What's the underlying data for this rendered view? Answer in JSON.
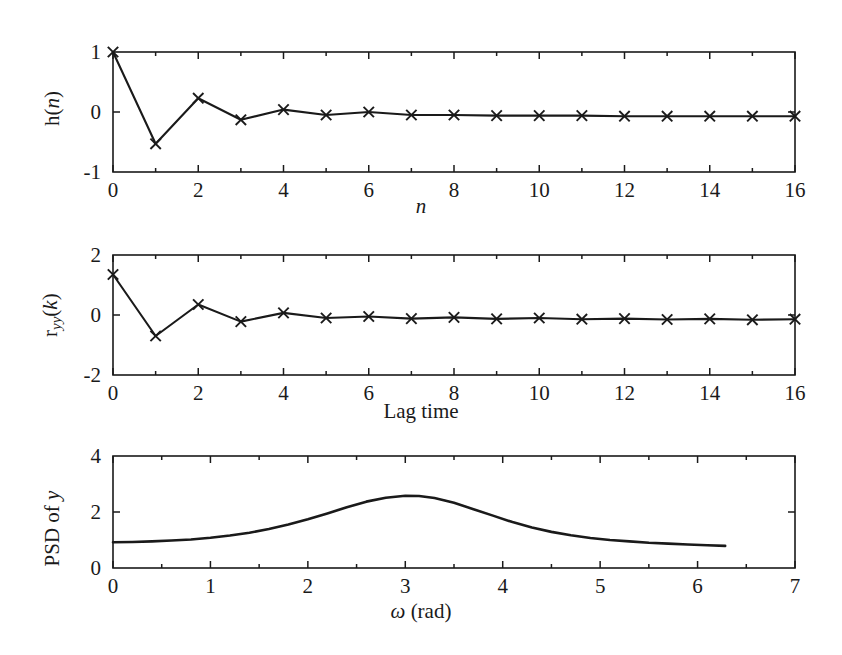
{
  "figure": {
    "background_color": "#ffffff",
    "line_color": "#1a1a1a",
    "marker_symbol": "x"
  },
  "panels": [
    {
      "name": "impulse-response",
      "ylabel_prefix": "h(",
      "ylabel_italic": "n",
      "ylabel_suffix": ")",
      "xlabel_italic": "n",
      "xlabel_prefix": "",
      "xlabel_suffix": "",
      "xticks": [
        "0",
        "2",
        "4",
        "6",
        "8",
        "10",
        "12",
        "14",
        "16"
      ],
      "yticks": [
        "-1",
        "0",
        "1"
      ]
    },
    {
      "name": "autocorrelation",
      "ylabel_prefix": "r",
      "ylabel_sub": "yy",
      "ylabel_mid": "(",
      "ylabel_italic": "k",
      "ylabel_suffix": ")",
      "xlabel": "Lag time",
      "xticks": [
        "0",
        "2",
        "4",
        "6",
        "8",
        "10",
        "12",
        "14",
        "16"
      ],
      "yticks": [
        "-2",
        "0",
        "2"
      ]
    },
    {
      "name": "power-spectral-density",
      "ylabel_prefix": "PSD of ",
      "ylabel_italic": "y",
      "xlabel_symbol": "ω",
      "xlabel_rest": " (rad)",
      "xticks": [
        "0",
        "1",
        "2",
        "3",
        "4",
        "5",
        "6",
        "7"
      ],
      "yticks": [
        "0",
        "2",
        "4"
      ]
    }
  ],
  "chart_data": [
    {
      "type": "line",
      "title": "",
      "xlabel": "n",
      "ylabel": "h(n)",
      "xlim": [
        0,
        16
      ],
      "ylim": [
        -1,
        1
      ],
      "xticks": [
        0,
        2,
        4,
        6,
        8,
        10,
        12,
        14,
        16
      ],
      "yticks": [
        -1,
        0,
        1
      ],
      "minor_xticks": [
        1,
        3,
        5,
        7,
        9,
        11,
        13,
        15
      ],
      "grid": false,
      "legend": null,
      "marker": "x",
      "x": [
        0,
        1,
        2,
        3,
        4,
        5,
        6,
        7,
        8,
        9,
        10,
        11,
        12,
        13,
        14,
        15,
        16
      ],
      "values": [
        1.0,
        -0.53,
        0.23,
        -0.13,
        0.04,
        -0.05,
        0.0,
        -0.05,
        -0.05,
        -0.06,
        -0.06,
        -0.06,
        -0.07,
        -0.07,
        -0.07,
        -0.07,
        -0.07
      ]
    },
    {
      "type": "line",
      "title": "",
      "xlabel": "Lag time",
      "ylabel": "r_yy(k)",
      "xlim": [
        0,
        16
      ],
      "ylim": [
        -2,
        2
      ],
      "xticks": [
        0,
        2,
        4,
        6,
        8,
        10,
        12,
        14,
        16
      ],
      "yticks": [
        -2,
        0,
        2
      ],
      "minor_xticks": [
        1,
        3,
        5,
        7,
        9,
        11,
        13,
        15
      ],
      "grid": false,
      "legend": null,
      "marker": "x",
      "x": [
        0,
        1,
        2,
        3,
        4,
        5,
        6,
        7,
        8,
        9,
        10,
        11,
        12,
        13,
        14,
        15,
        16
      ],
      "values": [
        1.35,
        -0.7,
        0.35,
        -0.22,
        0.07,
        -0.1,
        -0.05,
        -0.12,
        -0.08,
        -0.13,
        -0.1,
        -0.14,
        -0.12,
        -0.15,
        -0.13,
        -0.16,
        -0.14
      ]
    },
    {
      "type": "line",
      "title": "",
      "xlabel": "ω (rad)",
      "ylabel": "PSD of y",
      "xlim": [
        0,
        7
      ],
      "ylim": [
        0,
        4
      ],
      "xticks": [
        0,
        1,
        2,
        3,
        4,
        5,
        6,
        7
      ],
      "yticks": [
        0,
        2,
        4
      ],
      "minor_xticks": [
        0.5,
        1.5,
        2.5,
        3.5,
        4.5,
        5.5,
        6.5
      ],
      "grid": false,
      "legend": null,
      "marker": "none",
      "x": [
        0.0,
        0.2,
        0.4,
        0.6,
        0.8,
        1.0,
        1.2,
        1.4,
        1.6,
        1.8,
        2.0,
        2.2,
        2.4,
        2.6,
        2.8,
        3.0,
        3.1416,
        3.3,
        3.5,
        3.7,
        3.9,
        4.1,
        4.3,
        4.5,
        4.7,
        4.9,
        5.1,
        5.3,
        5.5,
        5.7,
        5.9,
        6.1,
        6.2832
      ],
      "values": [
        0.92,
        0.93,
        0.95,
        0.98,
        1.02,
        1.08,
        1.16,
        1.26,
        1.39,
        1.55,
        1.74,
        1.95,
        2.17,
        2.37,
        2.51,
        2.58,
        2.57,
        2.5,
        2.33,
        2.1,
        1.87,
        1.64,
        1.45,
        1.29,
        1.17,
        1.07,
        1.0,
        0.95,
        0.9,
        0.87,
        0.84,
        0.81,
        0.79
      ]
    }
  ]
}
